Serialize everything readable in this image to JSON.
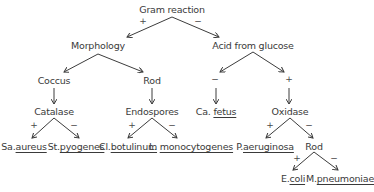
{
  "diagram": {
    "title": "Gram reaction",
    "nodes": {
      "root": "Gram reaction",
      "morphology": "Morphology",
      "acid": "Acid from glucose",
      "coccus": "Coccus",
      "rod1": "Rod",
      "catalase": "Catalase",
      "endospores": "Endospores",
      "oxidase": "Oxidase",
      "rod2": "Rod"
    },
    "leaves": {
      "sa_prefix": "Sa.",
      "sa_name": "aureus",
      "st_prefix": "St.",
      "st_name": "pyogenes",
      "cl_prefix": "Cl.",
      "cl_name": "botulinum",
      "l_prefix": "L.",
      "l_name": "monocytogenes",
      "ca_prefix": "Ca.",
      "ca_name": "fetus",
      "p_prefix": "P.",
      "p_name": "aeruginosa",
      "e_prefix": "E.",
      "e_name": "coli",
      "m_prefix": "M.",
      "m_name": "pneumoniae"
    },
    "signs": {
      "plus": "+",
      "minus": "−"
    }
  }
}
